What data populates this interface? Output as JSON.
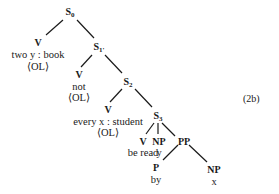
{
  "diagram": {
    "type": "syntax-tree",
    "label": "(2b)",
    "nodes": {
      "s0": {
        "cat": "S",
        "sub": "0"
      },
      "v1": {
        "cat": "V",
        "word": "two y : book",
        "mark": "⟨OL⟩"
      },
      "s1": {
        "cat": "S",
        "sub": "1'"
      },
      "v2": {
        "cat": "V",
        "word": "not",
        "mark": "⟨OL⟩"
      },
      "s2": {
        "cat": "S",
        "sub": "2"
      },
      "v3": {
        "cat": "V",
        "word": "every x : student",
        "mark": "⟨OL⟩"
      },
      "s3": {
        "cat": "S",
        "sub": "3"
      },
      "v4": {
        "cat": "V",
        "word": "be read"
      },
      "np1": {
        "cat": "NP",
        "word": "y"
      },
      "pp": {
        "cat": "PP"
      },
      "p": {
        "cat": "P",
        "word": "by"
      },
      "np2": {
        "cat": "NP",
        "word": "x"
      }
    },
    "edges": [
      [
        "S0",
        "V(two y:book)"
      ],
      [
        "S0",
        "S1'"
      ],
      [
        "S1'",
        "V(not)"
      ],
      [
        "S1'",
        "S2"
      ],
      [
        "S2",
        "V(every x:student)"
      ],
      [
        "S2",
        "S3"
      ],
      [
        "S3",
        "V(be read)"
      ],
      [
        "S3",
        "NP(y)"
      ],
      [
        "S3",
        "PP"
      ],
      [
        "PP",
        "P(by)"
      ],
      [
        "PP",
        "NP(x)"
      ]
    ]
  }
}
